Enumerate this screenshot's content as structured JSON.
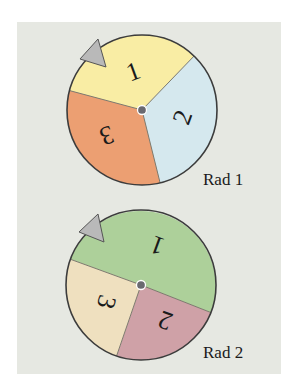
{
  "figure": {
    "background": "#e6e8e2",
    "spinners": [
      {
        "label": "Rad 1",
        "sectors": [
          {
            "number": "1",
            "color": "#f9eda4"
          },
          {
            "number": "2",
            "color": "#d5e8ee"
          },
          {
            "number": "3",
            "color": "#ec9f72"
          }
        ],
        "pointer_color": "#b9b9b9"
      },
      {
        "label": "Rad 2",
        "sectors": [
          {
            "number": "1",
            "color": "#add09a"
          },
          {
            "number": "2",
            "color": "#cfa1a7"
          },
          {
            "number": "3",
            "color": "#efe0bf"
          }
        ],
        "pointer_color": "#b9b9b9"
      }
    ]
  }
}
